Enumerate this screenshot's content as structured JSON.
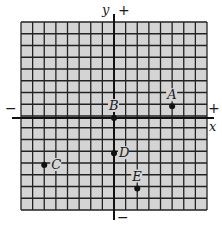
{
  "diagram": {
    "type": "coordinate-plane",
    "grid": {
      "columns": 16,
      "rows": 16,
      "background": "#d4d4d4",
      "line_color": "#222222"
    },
    "axes": {
      "x_label": "x",
      "y_label": "y",
      "x_positive_sign": "+",
      "x_negative_sign": "−",
      "y_positive_sign": "+",
      "y_negative_sign": "−",
      "origin_col": 8,
      "origin_row": 8
    },
    "points": [
      {
        "name": "A",
        "x": 5,
        "y": 1
      },
      {
        "name": "B",
        "x": 0,
        "y": 0
      },
      {
        "name": "C",
        "x": -6,
        "y": -4
      },
      {
        "name": "D",
        "x": 0,
        "y": -3
      },
      {
        "name": "E",
        "x": 2,
        "y": -6
      }
    ]
  }
}
